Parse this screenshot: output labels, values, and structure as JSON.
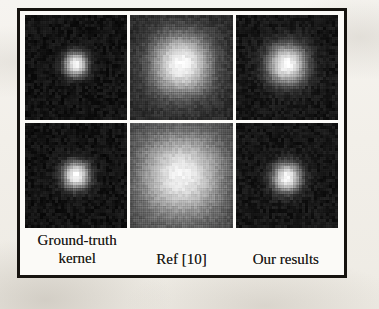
{
  "figure": {
    "caption_labels": [
      "Ground-truth kernel",
      "Ref [10]",
      "Our results"
    ],
    "frame_color": "#16130f",
    "background_color": "#f2efe9",
    "columns": [
      {
        "id": "ground-truth",
        "label_line1": "Ground-truth",
        "label_line2": "kernel"
      },
      {
        "id": "ref-10",
        "label_line1": "Ref [10]",
        "label_line2": ""
      },
      {
        "id": "our-results",
        "label_line1": "Our results",
        "label_line2": ""
      }
    ],
    "ghost_text": {
      "top": "",
      "right": "",
      "bottom_line1": "",
      "bottom_line2": "",
      "left": ""
    }
  },
  "chart_data": {
    "type": "heatmap",
    "title": "",
    "subtitle": "",
    "xlabel": "",
    "ylabel": "",
    "grid": false,
    "legend": "none",
    "colormap": "grayscale",
    "value_range": [
      0,
      1
    ],
    "layout": {
      "rows": 2,
      "cols": 3,
      "row_labels": [
        "example 1",
        "example 2"
      ],
      "col_labels": [
        "Ground-truth kernel",
        "Ref [10]",
        "Our results"
      ]
    },
    "panels": [
      {
        "row": 0,
        "col": 0,
        "column_label": "Ground-truth kernel",
        "description": "compact bright blur kernel on dark noisy background",
        "center": [
          0.5,
          0.47
        ],
        "radius_frac": 0.13,
        "peak": 1.0,
        "background": 0.06,
        "falloff": "gaussian"
      },
      {
        "row": 0,
        "col": 1,
        "column_label": "Ref [10]",
        "description": "over-smoothed wide kernel, blocky quantised halo",
        "center": [
          0.5,
          0.47
        ],
        "radius_frac": 0.34,
        "peak": 0.98,
        "background": 0.14,
        "falloff": "gaussian"
      },
      {
        "row": 0,
        "col": 2,
        "column_label": "Our results",
        "description": "moderately compact kernel close to ground truth",
        "center": [
          0.5,
          0.47
        ],
        "radius_frac": 0.22,
        "peak": 1.0,
        "background": 0.07,
        "falloff": "gaussian"
      },
      {
        "row": 1,
        "col": 0,
        "column_label": "Ground-truth kernel",
        "description": "compact bright blur kernel, slightly larger support",
        "center": [
          0.5,
          0.5
        ],
        "radius_frac": 0.15,
        "peak": 1.0,
        "background": 0.06,
        "falloff": "gaussian"
      },
      {
        "row": 1,
        "col": 1,
        "column_label": "Ref [10]",
        "description": "very broad washed-out kernel filling the patch, dark corners",
        "center": [
          0.5,
          0.5
        ],
        "radius_frac": 0.46,
        "peak": 0.95,
        "background": 0.24,
        "falloff": "gaussian"
      },
      {
        "row": 1,
        "col": 2,
        "column_label": "Our results",
        "description": "compact kernel closely matching ground truth",
        "center": [
          0.5,
          0.52
        ],
        "radius_frac": 0.16,
        "peak": 1.0,
        "background": 0.07,
        "falloff": "gaussian"
      }
    ]
  }
}
